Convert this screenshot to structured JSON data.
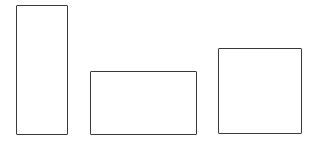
{
  "diagram": {
    "type": "hand-drawn rectangles",
    "background": "#ffffff",
    "stroke_color": "#3a3a3a",
    "shapes": [
      {
        "id": "rect-tall",
        "kind": "rectangle",
        "x": 16,
        "y": 5,
        "width": 52,
        "height": 130
      },
      {
        "id": "rect-wide",
        "kind": "rectangle",
        "x": 90,
        "y": 71,
        "width": 107,
        "height": 64
      },
      {
        "id": "rect-square",
        "kind": "rectangle",
        "x": 218,
        "y": 48,
        "width": 84,
        "height": 86
      }
    ]
  }
}
